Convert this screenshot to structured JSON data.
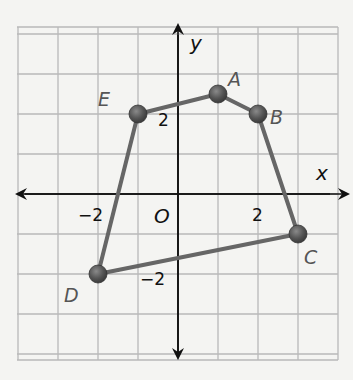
{
  "chart_data": {
    "type": "scatter",
    "title": "",
    "xlabel": "x",
    "ylabel": "y",
    "origin_label": "O",
    "grid": true,
    "xlim": [
      -4,
      4
    ],
    "ylim": [
      -4,
      4
    ],
    "x_ticks_labeled": [
      {
        "value": -2,
        "label": "−2"
      },
      {
        "value": 2,
        "label": "2"
      }
    ],
    "y_ticks_labeled": [
      {
        "value": 2,
        "label": "2"
      },
      {
        "value": -2,
        "label": "−2"
      }
    ],
    "polygon": {
      "name": "ABCDE",
      "closed": true,
      "vertices": [
        {
          "label": "A",
          "x": 1,
          "y": 2.5
        },
        {
          "label": "B",
          "x": 2,
          "y": 2
        },
        {
          "label": "C",
          "x": 3,
          "y": -1
        },
        {
          "label": "D",
          "x": -2,
          "y": -2
        },
        {
          "label": "E",
          "x": -1,
          "y": 2
        }
      ]
    },
    "colors": {
      "background": "#f4f4f2",
      "grid": "#b8b8b8",
      "axis": "#111111",
      "polygon_stroke": "#666666",
      "point_fill": "#555555",
      "vertex_label": "#555555"
    }
  }
}
